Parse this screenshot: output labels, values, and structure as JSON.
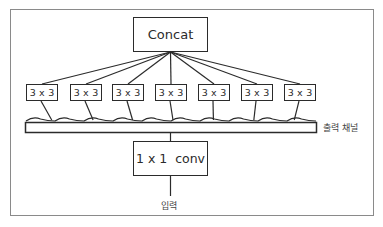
{
  "diagram": {
    "top_node": {
      "label": "Concat"
    },
    "branches": [
      {
        "label": "3 x 3",
        "cx": 42
      },
      {
        "label": "3 x 3",
        "cx": 86
      },
      {
        "label": "3 x 3",
        "cx": 128
      },
      {
        "label": "3 x 3",
        "cx": 171
      },
      {
        "label": "3 x 3",
        "cx": 214
      },
      {
        "label": "3 x 3",
        "cx": 257
      },
      {
        "label": "3 x 3",
        "cx": 300
      }
    ],
    "channel_bar": {
      "label": "출력 채널"
    },
    "bottom_node": {
      "label": "1 x 1  conv"
    },
    "input": {
      "label": "입력"
    }
  },
  "colors": {
    "stroke": "#2b2b2b",
    "frame": "#8a8a8a",
    "background": "#ffffff"
  }
}
